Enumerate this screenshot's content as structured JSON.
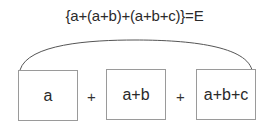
{
  "diagram": {
    "formula": "{a+(a+b)+(a+b+c)}=E",
    "boxes": [
      {
        "label": "a"
      },
      {
        "label": "a+b"
      },
      {
        "label": "a+b+c"
      }
    ],
    "operators": [
      "+",
      "+"
    ],
    "colors": {
      "text": "#2a2a2a",
      "box_border": "#9a9a9a",
      "arc": "#555555",
      "background": "#ffffff"
    }
  }
}
